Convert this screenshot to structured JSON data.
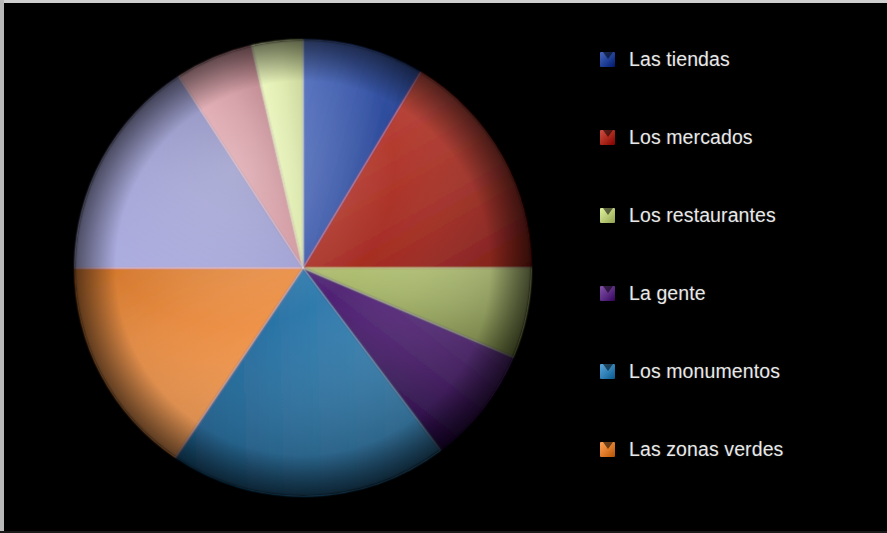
{
  "background_color": "#000000",
  "frame": {
    "border_color": "#cfcfcf"
  },
  "legend": {
    "position": "right",
    "text_color": "#e8e8e8",
    "items": [
      {
        "label": "Las tiendas",
        "color": "#1f3f96"
      },
      {
        "label": "Los mercados",
        "color": "#a8261a"
      },
      {
        "label": "Los restaurantes",
        "color": "#b9ca77"
      },
      {
        "label": "La gente",
        "color": "#5b2a82"
      },
      {
        "label": "Los monumentos",
        "color": "#2f7fb5"
      },
      {
        "label": "Las zonas verdes",
        "color": "#dd7a2a"
      }
    ]
  },
  "chart_data": {
    "type": "pie",
    "title": "",
    "subtitle": "",
    "xlabel": "",
    "ylabel": "",
    "grid": false,
    "legend_position": "right",
    "start_angle_deg": 0,
    "direction": "clockwise",
    "center": {
      "x": 230,
      "y": 230
    },
    "radius": 228,
    "categories": [
      "Las tiendas",
      "Los mercados",
      "Los restaurantes",
      "La gente",
      "Los monumentos",
      "Las zonas verdes",
      "Segmento 7",
      "Segmento 8",
      "Segmento 9"
    ],
    "values": [
      8.6,
      16.4,
      6.4,
      8.3,
      19.7,
      15.6,
      15.8,
      5.6,
      3.6
    ],
    "angles_deg": [
      31,
      59,
      23,
      30,
      71,
      56,
      57,
      20,
      13
    ],
    "colors": [
      "#1f3f96",
      "#a8261a",
      "#b9ca77",
      "#5b2a82",
      "#2f7fb5",
      "#dd7a2a",
      "#7b7cb4",
      "#b4737c",
      "#c3d18c"
    ],
    "labels_shown": false,
    "units": "%"
  }
}
